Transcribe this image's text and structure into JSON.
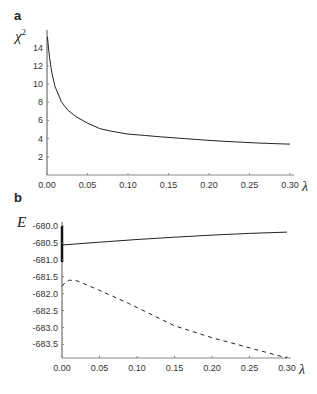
{
  "chart_data": [
    {
      "panel": "a",
      "type": "line",
      "title": "",
      "xlabel": "λ",
      "ylabel": "χ²",
      "xlim": [
        0,
        0.3
      ],
      "ylim": [
        0,
        15.5
      ],
      "grid": false,
      "x_ticks": [
        "0.00",
        "0.05",
        "0.10",
        "0.15",
        "0.20",
        "0.25",
        "0.30"
      ],
      "y_ticks": [
        "2",
        "4",
        "6",
        "8",
        "10",
        "12",
        "14"
      ],
      "series": [
        {
          "name": "χ²",
          "style": "solid",
          "x": [
            0.0005,
            0.003,
            0.006,
            0.01,
            0.018,
            0.026,
            0.036,
            0.05,
            0.065,
            0.08,
            0.1,
            0.12,
            0.14,
            0.17,
            0.2,
            0.23,
            0.26,
            0.29,
            0.3
          ],
          "y": [
            15.2,
            13.0,
            11.2,
            9.7,
            8.0,
            7.1,
            6.4,
            5.7,
            5.1,
            4.8,
            4.5,
            4.35,
            4.2,
            4.0,
            3.8,
            3.65,
            3.52,
            3.42,
            3.4
          ]
        }
      ]
    },
    {
      "panel": "b",
      "type": "line",
      "title": "",
      "xlabel": "λ",
      "ylabel": "E",
      "xlim": [
        0,
        0.3
      ],
      "ylim": [
        -683.9,
        -680.0
      ],
      "grid": false,
      "x_ticks": [
        "0.00",
        "0.05",
        "0.10",
        "0.15",
        "0.20",
        "0.25",
        "0.30"
      ],
      "y_ticks": [
        "-680.0",
        "-680.5",
        "-681.0",
        "-681.5",
        "-682.0",
        "-682.5",
        "-683.0",
        "-683.5"
      ],
      "series": [
        {
          "name": "upper",
          "style": "solid",
          "x": [
            0.0,
            0.05,
            0.1,
            0.15,
            0.2,
            0.25,
            0.3
          ],
          "y": [
            -680.56,
            -680.48,
            -680.4,
            -680.33,
            -680.27,
            -680.22,
            -680.18
          ]
        },
        {
          "name": "lower",
          "style": "dashed",
          "x": [
            0.0,
            0.005,
            0.01,
            0.02,
            0.05,
            0.09,
            0.15,
            0.2,
            0.25,
            0.3
          ],
          "y": [
            -681.78,
            -681.65,
            -681.6,
            -681.62,
            -681.9,
            -682.3,
            -682.95,
            -683.3,
            -683.6,
            -683.9
          ]
        }
      ]
    }
  ],
  "labels": {
    "panel_a": "a",
    "panel_b": "b",
    "a_ylabel": "χ",
    "a_ylabel_sup": "2",
    "b_ylabel": "E",
    "xlabel": "λ"
  }
}
